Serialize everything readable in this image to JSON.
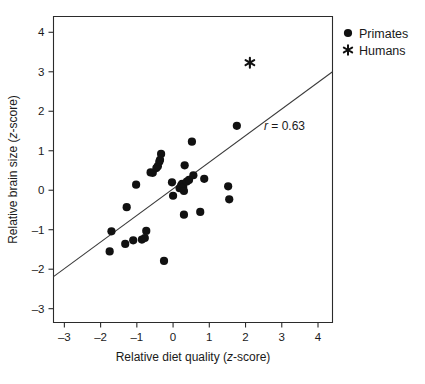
{
  "chart_data": {
    "type": "scatter",
    "title": "",
    "xlabel": "Relative diet quality (z-score)",
    "ylabel": "Relative brain size (z-score)",
    "xlim": [
      -3.3,
      4.4
    ],
    "ylim": [
      -3.35,
      4.4
    ],
    "xticks": [
      -3,
      -2,
      -1,
      0,
      1,
      2,
      3,
      4
    ],
    "xtick_labels": [
      "–3",
      "–2",
      "–1",
      "0",
      "1",
      "2",
      "3",
      "4"
    ],
    "yticks": [
      -3,
      -2,
      -1,
      0,
      1,
      2,
      3,
      4
    ],
    "ytick_labels": [
      "–3",
      "–2",
      "–1",
      "0",
      "1",
      "2",
      "3",
      "4"
    ],
    "grid": false,
    "annotation": "r = 0.63",
    "annotation_symbol": "r",
    "annotation_value": "= 0.63",
    "correlation": 0.63,
    "legend_position": "top-right-outside",
    "series": [
      {
        "name": "Primates",
        "marker": "circle",
        "color": "#111111",
        "points": [
          [
            -1.7,
            -1.04
          ],
          [
            -1.75,
            -1.55
          ],
          [
            -1.32,
            -1.36
          ],
          [
            -1.28,
            -0.43
          ],
          [
            -1.1,
            -1.27
          ],
          [
            -1.02,
            0.14
          ],
          [
            -0.86,
            -1.25
          ],
          [
            -0.78,
            -1.21
          ],
          [
            -0.74,
            -1.03
          ],
          [
            -0.62,
            0.45
          ],
          [
            -0.56,
            0.44
          ],
          [
            -0.46,
            0.56
          ],
          [
            -0.42,
            0.61
          ],
          [
            -0.38,
            0.72
          ],
          [
            -0.36,
            0.77
          ],
          [
            -0.33,
            0.92
          ],
          [
            -0.25,
            -1.79
          ],
          [
            -0.03,
            0.2
          ],
          [
            0.0,
            -0.14
          ],
          [
            0.18,
            0.05
          ],
          [
            0.22,
            0.12
          ],
          [
            0.25,
            0.16
          ],
          [
            0.28,
            0.08
          ],
          [
            0.3,
            -0.02
          ],
          [
            0.32,
            0.63
          ],
          [
            0.3,
            -0.62
          ],
          [
            0.38,
            0.22
          ],
          [
            0.44,
            0.26
          ],
          [
            0.52,
            1.23
          ],
          [
            0.56,
            0.38
          ],
          [
            0.75,
            -0.55
          ],
          [
            0.86,
            0.29
          ],
          [
            1.52,
            0.1
          ],
          [
            1.55,
            -0.23
          ],
          [
            1.76,
            1.63
          ]
        ]
      },
      {
        "name": "Humans",
        "marker": "asterisk",
        "color": "#111111",
        "points": [
          [
            2.12,
            3.23
          ]
        ]
      }
    ],
    "fit_line": {
      "label": "regression line",
      "x0": -3.3,
      "y0": -2.19,
      "x1": 4.4,
      "y1": 3.0
    }
  },
  "legend": {
    "items": [
      {
        "label": "Primates",
        "marker": "circle"
      },
      {
        "label": "Humans",
        "marker": "asterisk"
      }
    ]
  }
}
